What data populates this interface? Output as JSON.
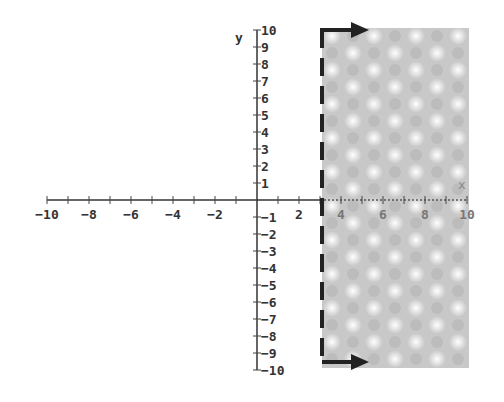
{
  "chart_data": {
    "type": "inequality-graph",
    "title": "",
    "xlabel": "x",
    "ylabel": "y",
    "xlim": [
      -10,
      10
    ],
    "ylim": [
      -10,
      10
    ],
    "x_ticks_labeled": [
      -10,
      -8,
      -6,
      -4,
      -2,
      2,
      4,
      6,
      8,
      10
    ],
    "y_ticks_labeled": [
      10,
      9,
      8,
      7,
      6,
      5,
      4,
      3,
      2,
      1,
      -1,
      -2,
      -3,
      -4,
      -5,
      -6,
      -7,
      -8,
      -9,
      -10
    ],
    "grid": false,
    "boundary": {
      "type": "vertical-line",
      "x": 3,
      "style": "dashed"
    },
    "shaded_region": {
      "inequality": "x > 3",
      "x_from": 3,
      "x_to": 10,
      "pattern": "checkered-gray"
    },
    "arrows": [
      {
        "at_y": 10,
        "direction": "right"
      },
      {
        "at_y": -10,
        "direction": "right"
      }
    ]
  },
  "labels": {
    "x_axis": "x",
    "y_axis": "y"
  }
}
